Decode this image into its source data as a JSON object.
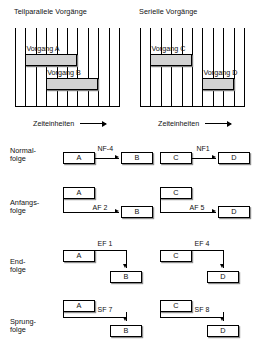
{
  "charts": [
    {
      "title": "Teilparallele Vorgänge",
      "axis_caption": "Zeiteinheiten",
      "time_units": 10,
      "bars": [
        {
          "label": "Vorgang A",
          "start": 1,
          "duration": 5
        },
        {
          "label": "Vorgang B",
          "start": 3,
          "duration": 5
        }
      ]
    },
    {
      "title": "Serielle Vorgänge",
      "axis_caption": "Zeiteinheiten",
      "time_units": 10,
      "bars": [
        {
          "label": "Vorgang C",
          "start": 1,
          "duration": 4
        },
        {
          "label": "Vorgang D",
          "start": 6,
          "duration": 3
        }
      ]
    }
  ],
  "relations": [
    {
      "name": "normalfolge",
      "label_line1": "Normal-",
      "label_line2": "folge",
      "left": {
        "from": "A",
        "to": "B",
        "link": "NF-4"
      },
      "right": {
        "from": "C",
        "to": "D",
        "link": "NF1"
      }
    },
    {
      "name": "anfangsfolge",
      "label_line1": "Anfangs-",
      "label_line2": "folge",
      "left": {
        "from": "A",
        "to": "B",
        "link": "AF 2"
      },
      "right": {
        "from": "C",
        "to": "D",
        "link": "AF 5"
      }
    },
    {
      "name": "endfolge",
      "label_line1": "End-",
      "label_line2": "folge",
      "left": {
        "from": "A",
        "to": "B",
        "link": "EF 1"
      },
      "right": {
        "from": "C",
        "to": "D",
        "link": "EF 4"
      }
    },
    {
      "name": "sprungfolge",
      "label_line1": "Sprung-",
      "label_line2": "folge",
      "left": {
        "from": "A",
        "to": "B",
        "link": "SF 7"
      },
      "right": {
        "from": "C",
        "to": "D",
        "link": "SF 8"
      }
    }
  ],
  "chart_data": {
    "type": "bar",
    "xlabel": "Zeiteinheiten",
    "ylabel": "",
    "grid": true,
    "charts": [
      {
        "title": "Teilparallele Vorgänge",
        "xlim": [
          0,
          10
        ],
        "categories": [
          "Vorgang A",
          "Vorgang B"
        ],
        "series": [
          {
            "name": "start",
            "values": [
              1,
              3
            ]
          },
          {
            "name": "duration",
            "values": [
              5,
              5
            ]
          },
          {
            "name": "end",
            "values": [
              6,
              8
            ]
          }
        ]
      },
      {
        "title": "Serielle Vorgänge",
        "xlim": [
          0,
          10
        ],
        "categories": [
          "Vorgang C",
          "Vorgang D"
        ],
        "series": [
          {
            "name": "start",
            "values": [
              1,
              6
            ]
          },
          {
            "name": "duration",
            "values": [
              4,
              3
            ]
          },
          {
            "name": "end",
            "values": [
              5,
              9
            ]
          }
        ]
      }
    ],
    "relations": [
      {
        "type": "Normalfolge",
        "left": "NF-4",
        "right": "NF1"
      },
      {
        "type": "Anfangsfolge",
        "left": "AF 2",
        "right": "AF 5"
      },
      {
        "type": "Endfolge",
        "left": "EF 1",
        "right": "EF 4"
      },
      {
        "type": "Sprungfolge",
        "left": "SF 7",
        "right": "SF 8"
      }
    ]
  }
}
